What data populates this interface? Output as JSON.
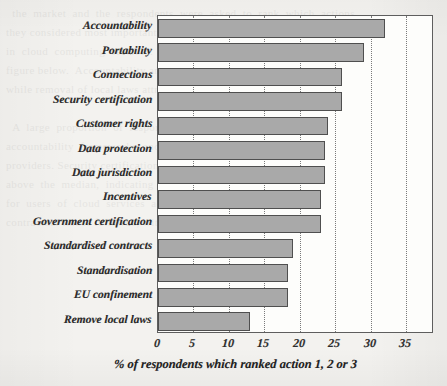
{
  "chart_data": {
    "type": "bar",
    "orientation": "horizontal",
    "title": "",
    "subtitle": "",
    "xlabel": "% of respondents which ranked action 1, 2 or 3",
    "ylabel": "",
    "xlim": [
      0,
      38.9
    ],
    "xticks": [
      0,
      5,
      10,
      15,
      20,
      25,
      30,
      35
    ],
    "xtick_labels": [
      "0",
      "5",
      "10",
      "15",
      "20",
      "25",
      "30",
      "35"
    ],
    "grid": "vertical-dotted",
    "legend": "none",
    "bar_color": "#a9a9a9",
    "bar_edge_color": "#4f4f4f",
    "plot_background": "#fdfdfb",
    "page_background": "#f3f2ef",
    "categories": [
      "Accountability",
      "Portability",
      "Connections",
      "Security certification",
      "Customer rights",
      "Data protection",
      "Data jurisdiction",
      "Incentives",
      "Government certification",
      "Standardised contracts",
      "Standardisation",
      "EU confinement",
      "Remove local laws"
    ],
    "values": [
      32,
      29,
      26,
      26,
      24,
      23.5,
      23.5,
      23,
      23,
      19,
      18.3,
      18.3,
      13
    ]
  },
  "ghost_text": "  the  market  and  the  respondents  were  asked  to  rank  which  actions\nthey considered most important for the development of the single market\nin  cloud  computing  services.   The  results  are  summarised  in  the\nfigure below.  Accountability and portability were ranked highest,\nwhile removal of local laws attracted the least support overall.\n\n  A  large  proportion  of  respondents  highlighted  the  need  for  clear\naccountability  frameworks  and  the  ability  to  move  data  between\nproviders. Security certification and customer rights also scored well\nabove  the  median,  indicating  that  trust  remains  a  central  concern\nfor  users  of  cloud  services  across  the  union.   Standardisation  and\ncontractual issues followed, with government certification in between."
}
